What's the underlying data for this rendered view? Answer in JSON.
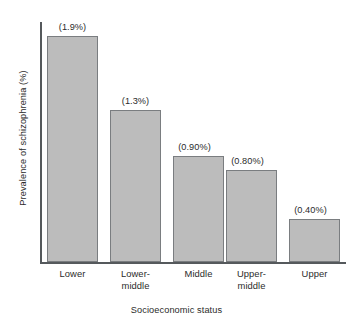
{
  "chart_data": {
    "type": "bar",
    "title": "",
    "subtitle": "",
    "xlabel": "Socioeconomic status",
    "ylabel": "Prevalence of schizophrenia (%)",
    "categories": [
      "Lower",
      "Lower-\nmiddle",
      "Middle",
      "Upper-\nmiddle",
      "Upper"
    ],
    "values": [
      1.9,
      1.3,
      0.9,
      0.8,
      0.4
    ],
    "data_labels": [
      "(1.9%)",
      "(1.3%)",
      "(0.90%)",
      "(0.80%)",
      "(0.40%)"
    ],
    "ylim": [
      0,
      2.0
    ],
    "grid": false,
    "legend": null,
    "tick_labels_y": [],
    "bar_fill_color": "#bcbcbc",
    "bar_edge_color": "#7a7d80",
    "axis_color": "#55595c",
    "background_color": "#ffffff"
  },
  "bars": [
    {
      "label": "Lower",
      "value_text": "(1.9%)",
      "left": 47,
      "width": 51,
      "top": 36,
      "label_left": 37,
      "label_top": 268,
      "value_left": 37,
      "value_top": 22
    },
    {
      "label": "Lower-\nmiddle",
      "value_text": "(1.3%)",
      "left": 110,
      "width": 51,
      "top": 110,
      "label_left": 100,
      "label_top": 268,
      "value_left": 100,
      "value_top": 96
    },
    {
      "label": "Middle",
      "value_text": "(0.90%)",
      "left": 173,
      "width": 51,
      "top": 156,
      "label_left": 163,
      "label_top": 268,
      "value_left": 159,
      "value_top": 142
    },
    {
      "label": "Upper-\nmiddle",
      "value_text": "(0.80%)",
      "left": 226,
      "width": 51,
      "top": 170,
      "label_left": 216,
      "label_top": 268,
      "value_left": 212,
      "value_top": 156
    },
    {
      "label": "Upper",
      "value_text": "(0.40%)",
      "left": 289,
      "width": 51,
      "top": 219,
      "label_left": 279,
      "label_top": 268,
      "value_left": 275,
      "value_top": 205
    }
  ]
}
